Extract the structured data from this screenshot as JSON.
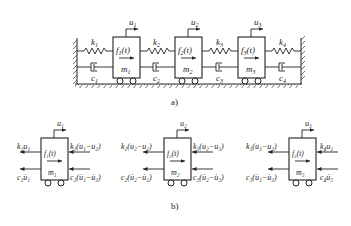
{
  "figure_a": {
    "caption": "a)",
    "masses": [
      {
        "name": "m",
        "sub": "1",
        "force": "f",
        "force_sub": "1",
        "force_arg": "(t)",
        "disp": "u",
        "disp_sub": "1"
      },
      {
        "name": "m",
        "sub": "2",
        "force": "f",
        "force_sub": "2",
        "force_arg": "(t)",
        "disp": "u",
        "disp_sub": "2"
      },
      {
        "name": "m",
        "sub": "3",
        "force": "f",
        "force_sub": "3",
        "force_arg": "(t)",
        "disp": "u",
        "disp_sub": "3"
      }
    ],
    "springs": [
      {
        "sym": "k",
        "sub": "1"
      },
      {
        "sym": "k",
        "sub": "2"
      },
      {
        "sym": "k",
        "sub": "3"
      },
      {
        "sym": "k",
        "sub": "4"
      }
    ],
    "dampers": [
      {
        "sym": "c",
        "sub": "1"
      },
      {
        "sym": "c",
        "sub": "2"
      },
      {
        "sym": "c",
        "sub": "3"
      },
      {
        "sym": "c",
        "sub": "4"
      }
    ]
  },
  "figure_b": {
    "caption": "b)",
    "free_bodies": [
      {
        "mass": "m₁",
        "force": "f₁(t)",
        "disp": "u₁",
        "left_spring": "k₁u₁",
        "right_spring": "k₂(u₁−u₂)",
        "left_damper": "c₁u̇₁",
        "right_damper": "c₂(u̇₁−u̇₂)"
      },
      {
        "mass": "m₂",
        "force": "f₂(t)",
        "disp": "u₂",
        "left_spring": "k₂(u₂−u₁)",
        "right_spring": "k₃(u₂−u₃)",
        "left_damper": "c₂(u̇₂−u̇₁)",
        "right_damper": "c₃(u̇₂−u̇₃)"
      },
      {
        "mass": "m₃",
        "force": "f₃(t)",
        "disp": "u₃",
        "left_spring": "k₃(u₃−u₂)",
        "right_spring": "k₄u₃",
        "left_damper": "c₃(u̇₃−u̇₂)",
        "right_damper": "c₄u̇₃"
      }
    ]
  }
}
